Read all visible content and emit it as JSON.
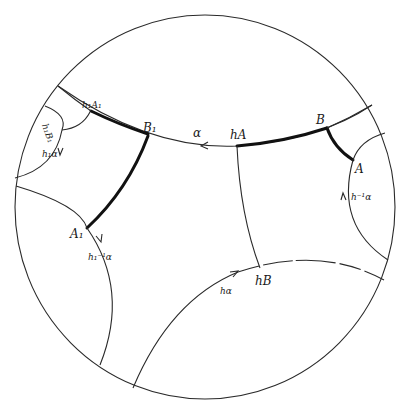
{
  "figure": {
    "type": "hyperbolic-disk-diagram",
    "stroke_color": "#2a2a2a",
    "thick_color": "#111111",
    "background": "#ffffff"
  },
  "labels": {
    "alpha": "α",
    "hA": "hA",
    "B": "B",
    "A": "A",
    "h_inv_alpha": "h⁻¹α",
    "h1A1": "h₁A₁",
    "B1": "B₁",
    "h1B1": "h₁B₁",
    "h1_alpha": "h₁α",
    "A1": "A₁",
    "h1_inv_alpha": "h₁⁻¹α",
    "hB": "hB",
    "h_alpha": "hα"
  }
}
